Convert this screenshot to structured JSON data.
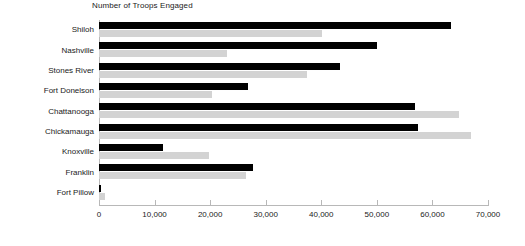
{
  "chart_data": {
    "type": "bar",
    "orientation": "horizontal",
    "title": "Number of Troops Engaged",
    "xlabel": "",
    "ylabel": "",
    "xlim": [
      0,
      70000
    ],
    "xticks": [
      0,
      10000,
      20000,
      30000,
      40000,
      50000,
      60000,
      70000
    ],
    "xticklabels": [
      "0",
      "10,000",
      "20,000",
      "30,000",
      "40,000",
      "50,000",
      "60,000",
      "70,000"
    ],
    "grid": false,
    "legend": "none",
    "categories": [
      "Shiloh",
      "Nashville",
      "Stones River",
      "Fort Donelson",
      "Chattanooga",
      "Chickamauga",
      "Knoxville",
      "Franklin",
      "Fort Pillow"
    ],
    "series": [
      {
        "name": "series-1",
        "color": "#000000",
        "values": [
          63300,
          50100,
          43400,
          26800,
          56800,
          57400,
          11500,
          27700,
          300
        ]
      },
      {
        "name": "series-2",
        "color": "#d3d3d3",
        "values": [
          40100,
          23000,
          37400,
          20300,
          64700,
          66900,
          19800,
          26400,
          1000
        ]
      }
    ]
  },
  "colors": {
    "series_black": "#000000",
    "series_gray": "#d3d3d3",
    "axis": "#b8b8b8",
    "text": "#1a1a1a",
    "background": "#ffffff"
  }
}
